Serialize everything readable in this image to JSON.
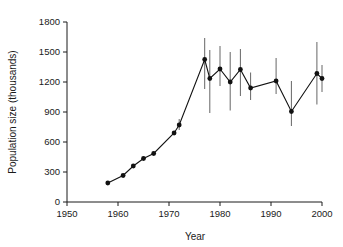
{
  "chart_data": {
    "type": "line",
    "title": "",
    "xlabel": "Year",
    "ylabel": "Population size (thousands)",
    "xlim": [
      1950,
      2000
    ],
    "ylim": [
      0,
      1800
    ],
    "xticks": [
      1950,
      1960,
      1970,
      1980,
      1990,
      2000
    ],
    "yticks": [
      0,
      300,
      600,
      900,
      1200,
      1500,
      1800
    ],
    "xtick_labels": [
      "1950",
      "1960",
      "1970",
      "1980",
      "1990",
      "2000"
    ],
    "ytick_labels": [
      "0",
      "300",
      "600",
      "900",
      "1200",
      "1500",
      "1800"
    ],
    "grid": false,
    "legend": "none",
    "series": [
      {
        "name": "Population size",
        "x": [
          1958,
          1961,
          1963,
          1965,
          1967,
          1971,
          1972,
          1977,
          1978,
          1980,
          1982,
          1984,
          1986,
          1991,
          1994,
          1999,
          2000
        ],
        "values": [
          190,
          265,
          360,
          435,
          485,
          690,
          770,
          1425,
          1235,
          1330,
          1200,
          1325,
          1140,
          1210,
          905,
          1285,
          1235
        ],
        "error_low": [
          null,
          null,
          null,
          null,
          null,
          null,
          720,
          1130,
          890,
          1160,
          915,
          1060,
          1020,
          1080,
          760,
          975,
          1100
        ],
        "error_high": [
          null,
          null,
          null,
          null,
          null,
          null,
          830,
          1640,
          1520,
          1560,
          1500,
          1530,
          1295,
          1440,
          1210,
          1600,
          1370
        ],
        "marker": "filled-circle",
        "color": "#111111"
      }
    ]
  }
}
